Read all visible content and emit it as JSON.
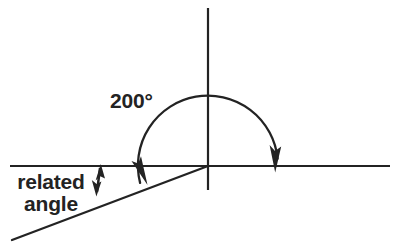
{
  "figure": {
    "background_color": "#ffffff",
    "stroke_color": "#232323",
    "labels": {
      "angle_measure": "200°",
      "related_angle_line1": "related",
      "related_angle_line2": "angle"
    },
    "geometry": {
      "origin": {
        "x": 208,
        "y": 166
      },
      "horizontal_axis": {
        "x1": 10,
        "y1": 166,
        "x2": 390,
        "y2": 166
      },
      "vertical_axis": {
        "x1": 208,
        "y1": 8,
        "x2": 208,
        "y2": 190
      },
      "terminal_side": {
        "x1": 12,
        "y1": 240,
        "x2": 208,
        "y2": 166
      },
      "arc_radius": 70,
      "arc_start_degrees": 0,
      "arc_end_degrees": 200,
      "arc_direction": "counterclockwise",
      "arrowhead_start": {
        "x": 275,
        "y": 167,
        "points": "down"
      },
      "arrowhead_end": {
        "x": 145,
        "y": 181,
        "points": "down-right"
      },
      "related_angle_marker": {
        "x": 99,
        "y_top": 166,
        "y_bottom": 194,
        "style": "double-headed-arrow"
      }
    }
  },
  "chart_data": {
    "type": "diagram",
    "annotations": [
      "200°",
      "related angle"
    ],
    "angle_degrees": 200,
    "related_angle_degrees": 20
  }
}
